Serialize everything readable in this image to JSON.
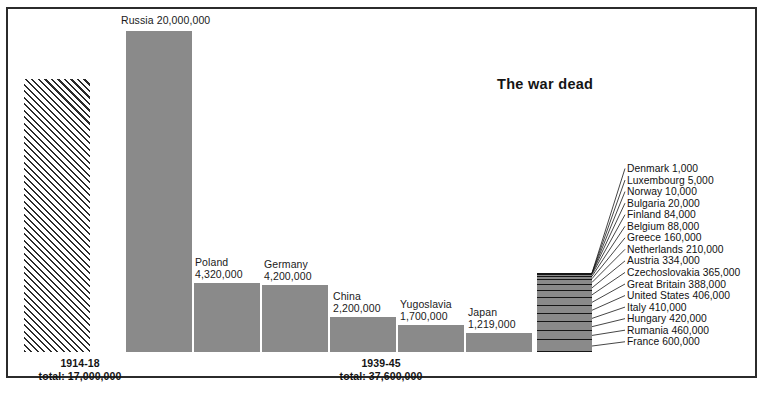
{
  "title": "The war dead",
  "chart_data": {
    "type": "bar",
    "title": "The war dead",
    "xlabel": "",
    "ylabel": "",
    "grid": false,
    "legend": "none",
    "value_axis_note": "Bar height proportional to number of war dead; common baseline.",
    "groups": [
      {
        "id": "ww1",
        "caption_period": "1914-18",
        "caption_total": "total: 17,000,000",
        "total": 17000000,
        "fill": "diagonal-hatch",
        "bars": [
          {
            "label": "",
            "value_text": "",
            "value": 17000000
          }
        ]
      },
      {
        "id": "ww2",
        "caption_period": "1939-45",
        "caption_total": "total: 37,600,000",
        "total": 37600000,
        "fill": "solid-gray",
        "bars": [
          {
            "label": "Russia",
            "value_text": "20,000,000",
            "value": 20000000
          },
          {
            "label": "Poland",
            "value_text": "4,320,000",
            "value": 4320000
          },
          {
            "label": "Germany",
            "value_text": "4,200,000",
            "value": 4200000
          },
          {
            "label": "China",
            "value_text": "2,200,000",
            "value": 2200000
          },
          {
            "label": "Yugoslavia",
            "value_text": "1,700,000",
            "value": 1700000
          },
          {
            "label": "Japan",
            "value_text": "1,219,000",
            "value": 1219000
          }
        ]
      }
    ],
    "stacked_bar": {
      "id": "other-countries",
      "note": "Stacked bar of remaining countries, smallest at top",
      "segments": [
        {
          "label": "Denmark",
          "value_text": "1,000",
          "value": 1000
        },
        {
          "label": "Luxembourg",
          "value_text": "5,000",
          "value": 5000
        },
        {
          "label": "Norway",
          "value_text": "10,000",
          "value": 10000
        },
        {
          "label": "Bulgaria",
          "value_text": "20,000",
          "value": 20000
        },
        {
          "label": "Finland",
          "value_text": "84,000",
          "value": 84000
        },
        {
          "label": "Belgium",
          "value_text": "88,000",
          "value": 88000
        },
        {
          "label": "Greece",
          "value_text": "160,000",
          "value": 160000
        },
        {
          "label": "Netherlands",
          "value_text": "210,000",
          "value": 210000
        },
        {
          "label": "Austria",
          "value_text": "334,000",
          "value": 334000
        },
        {
          "label": "Czechoslovakia",
          "value_text": "365,000",
          "value": 365000
        },
        {
          "label": "Great Britain",
          "value_text": "388,000",
          "value": 388000
        },
        {
          "label": "United States",
          "value_text": "406,000",
          "value": 406000
        },
        {
          "label": "Italy",
          "value_text": "410,000",
          "value": 410000
        },
        {
          "label": "Hungary",
          "value_text": "420,000",
          "value": 420000
        },
        {
          "label": "Rumania",
          "value_text": "460,000",
          "value": 460000
        },
        {
          "label": "France",
          "value_text": "600,000",
          "value": 600000
        }
      ]
    },
    "colors": {
      "bar_fill": "#8a8a8a",
      "rule": "#161616",
      "text": "#111111",
      "frame": "#2b2b2b",
      "background": "#ffffff"
    }
  },
  "bar_labels": {
    "russia": "Russia 20,000,000",
    "poland": "Poland\n4,320,000",
    "germany": "Germany\n4,200,000",
    "china": "China\n2,200,000",
    "yugoslavia": "Yugoslavia\n1,700,000",
    "japan": "Japan\n1,219,000"
  },
  "captions": {
    "ww1": "1914-18\ntotal: 17,000,000",
    "ww2": "1939-45\ntotal: 37,600,000"
  },
  "annotations": [
    "Denmark 1,000",
    "Luxembourg 5,000",
    "Norway 10,000",
    "Bulgaria 20,000",
    "Finland 84,000",
    "Belgium 88,000",
    "Greece 160,000",
    "Netherlands 210,000",
    "Austria 334,000",
    "Czechoslovakia 365,000",
    "Great Britain 388,000",
    "United States 406,000",
    "Italy 410,000",
    "Hungary 420,000",
    "Rumania 460,000",
    "France 600,000"
  ]
}
